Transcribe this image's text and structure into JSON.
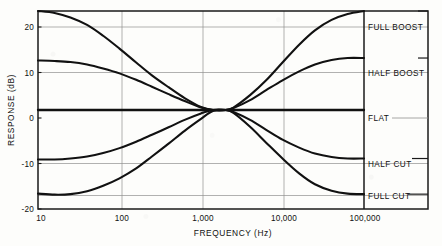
{
  "chart_data": {
    "type": "line",
    "title": "",
    "xlabel": "FREQUENCY (Hz)",
    "ylabel": "RESPONSE (dB)",
    "xscale": "log",
    "xlim": [
      10,
      100000
    ],
    "ylim": [
      -20,
      20
    ],
    "xticks": [
      10,
      100,
      1000,
      10000,
      100000
    ],
    "xtick_labels": [
      "10",
      "100",
      "1,000",
      "10,000",
      "100,000"
    ],
    "yticks": [
      20,
      10,
      0,
      -10,
      -20
    ],
    "ytick_labels": [
      "20",
      "10",
      "0",
      "-10",
      "-20"
    ],
    "grid": true,
    "legend_position": "right-column",
    "series": [
      {
        "name": "FULL BOOST",
        "low_freq_level_db": 20,
        "high_freq_level_db": 20,
        "mid_null_db": 0,
        "points": [
          {
            "f": 10,
            "db": 20.0
          },
          {
            "f": 16,
            "db": 19.6
          },
          {
            "f": 25,
            "db": 18.7
          },
          {
            "f": 40,
            "db": 17.2
          },
          {
            "f": 63,
            "db": 15.0
          },
          {
            "f": 100,
            "db": 12.4
          },
          {
            "f": 160,
            "db": 9.6
          },
          {
            "f": 250,
            "db": 7.0
          },
          {
            "f": 400,
            "db": 4.6
          },
          {
            "f": 630,
            "db": 2.4
          },
          {
            "f": 1000,
            "db": 0.6
          },
          {
            "f": 1400,
            "db": 0.0
          },
          {
            "f": 2000,
            "db": 0.0
          },
          {
            "f": 2500,
            "db": 0.5
          },
          {
            "f": 4000,
            "db": 3.0
          },
          {
            "f": 6300,
            "db": 6.0
          },
          {
            "f": 10000,
            "db": 9.6
          },
          {
            "f": 16000,
            "db": 13.2
          },
          {
            "f": 25000,
            "db": 16.1
          },
          {
            "f": 40000,
            "db": 18.2
          },
          {
            "f": 63000,
            "db": 19.4
          },
          {
            "f": 100000,
            "db": 20.0
          }
        ]
      },
      {
        "name": "HALF BOOST",
        "low_freq_level_db": 10,
        "high_freq_level_db": 10.5,
        "mid_null_db": 0,
        "points": [
          {
            "f": 10,
            "db": 10.0
          },
          {
            "f": 16,
            "db": 9.9
          },
          {
            "f": 25,
            "db": 9.7
          },
          {
            "f": 40,
            "db": 9.2
          },
          {
            "f": 63,
            "db": 8.4
          },
          {
            "f": 100,
            "db": 7.4
          },
          {
            "f": 160,
            "db": 6.1
          },
          {
            "f": 250,
            "db": 4.7
          },
          {
            "f": 400,
            "db": 3.2
          },
          {
            "f": 630,
            "db": 1.8
          },
          {
            "f": 1000,
            "db": 0.5
          },
          {
            "f": 1400,
            "db": 0.0
          },
          {
            "f": 2000,
            "db": 0.0
          },
          {
            "f": 2500,
            "db": 0.4
          },
          {
            "f": 4000,
            "db": 2.0
          },
          {
            "f": 6300,
            "db": 4.0
          },
          {
            "f": 10000,
            "db": 6.0
          },
          {
            "f": 16000,
            "db": 7.8
          },
          {
            "f": 25000,
            "db": 9.2
          },
          {
            "f": 40000,
            "db": 10.1
          },
          {
            "f": 63000,
            "db": 10.5
          },
          {
            "f": 100000,
            "db": 10.5
          }
        ]
      },
      {
        "name": "FLAT",
        "low_freq_level_db": 0,
        "high_freq_level_db": 0,
        "mid_null_db": 0,
        "points": [
          {
            "f": 10,
            "db": 0
          },
          {
            "f": 100,
            "db": 0
          },
          {
            "f": 1000,
            "db": 0
          },
          {
            "f": 10000,
            "db": 0
          },
          {
            "f": 100000,
            "db": 0
          }
        ]
      },
      {
        "name": "HALF CUT",
        "low_freq_level_db": -10,
        "high_freq_level_db": -9.8,
        "mid_null_db": 0,
        "points": [
          {
            "f": 10,
            "db": -10.0
          },
          {
            "f": 16,
            "db": -10.0
          },
          {
            "f": 25,
            "db": -9.8
          },
          {
            "f": 40,
            "db": -9.4
          },
          {
            "f": 63,
            "db": -8.7
          },
          {
            "f": 100,
            "db": -7.7
          },
          {
            "f": 160,
            "db": -6.4
          },
          {
            "f": 250,
            "db": -5.0
          },
          {
            "f": 400,
            "db": -3.5
          },
          {
            "f": 630,
            "db": -2.0
          },
          {
            "f": 1000,
            "db": -0.7
          },
          {
            "f": 1400,
            "db": 0.0
          },
          {
            "f": 2000,
            "db": 0.0
          },
          {
            "f": 2500,
            "db": -0.4
          },
          {
            "f": 4000,
            "db": -2.0
          },
          {
            "f": 6300,
            "db": -4.0
          },
          {
            "f": 10000,
            "db": -6.0
          },
          {
            "f": 16000,
            "db": -7.6
          },
          {
            "f": 25000,
            "db": -8.8
          },
          {
            "f": 40000,
            "db": -9.5
          },
          {
            "f": 63000,
            "db": -9.8
          },
          {
            "f": 100000,
            "db": -9.8
          }
        ]
      },
      {
        "name": "FULL CUT",
        "low_freq_level_db": -17,
        "high_freq_level_db": -17,
        "mid_null_db": 0,
        "points": [
          {
            "f": 10,
            "db": -16.9
          },
          {
            "f": 16,
            "db": -17.1
          },
          {
            "f": 25,
            "db": -17.0
          },
          {
            "f": 40,
            "db": -16.4
          },
          {
            "f": 63,
            "db": -15.3
          },
          {
            "f": 100,
            "db": -13.8
          },
          {
            "f": 160,
            "db": -11.8
          },
          {
            "f": 250,
            "db": -9.4
          },
          {
            "f": 400,
            "db": -6.8
          },
          {
            "f": 630,
            "db": -4.2
          },
          {
            "f": 1000,
            "db": -1.8
          },
          {
            "f": 1400,
            "db": -0.2
          },
          {
            "f": 2000,
            "db": 0.0
          },
          {
            "f": 2500,
            "db": -0.6
          },
          {
            "f": 4000,
            "db": -3.4
          },
          {
            "f": 6300,
            "db": -6.6
          },
          {
            "f": 10000,
            "db": -9.8
          },
          {
            "f": 16000,
            "db": -12.8
          },
          {
            "f": 25000,
            "db": -15.0
          },
          {
            "f": 40000,
            "db": -16.3
          },
          {
            "f": 63000,
            "db": -16.9
          },
          {
            "f": 100000,
            "db": -17.0
          }
        ]
      }
    ]
  },
  "axes": {
    "y_title": "RESPONSE (dB)",
    "x_title": "FREQUENCY (Hz)",
    "y_tick_20": "20",
    "y_tick_10": "10",
    "y_tick_0": "0",
    "y_tick_neg10": "-10",
    "y_tick_neg20": "-20",
    "x_tick_10": "10",
    "x_tick_100": "100",
    "x_tick_1000": "1,000",
    "x_tick_10000": "10,000",
    "x_tick_100000": "100,000"
  },
  "legend": {
    "full_boost": "FULL BOOST",
    "half_boost": "HALF BOOST",
    "flat": "FLAT",
    "half_cut": "HALF CUT",
    "full_cut": "FULL CUT"
  },
  "colors": {
    "curve": "#111111",
    "grid": "#8f8f8f",
    "frame": "#1a1a1a",
    "background": "#fdfdfb"
  }
}
